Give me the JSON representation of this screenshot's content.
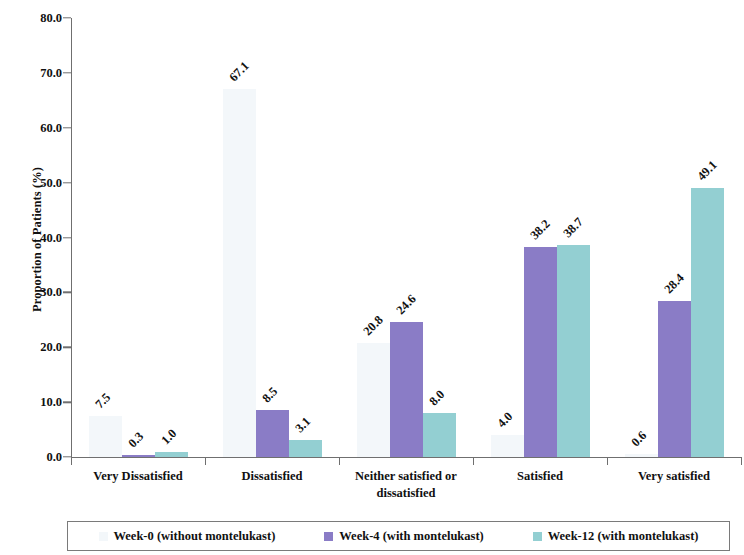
{
  "chart_data": {
    "type": "bar",
    "title": "",
    "xlabel": "",
    "ylabel": "Proportion of Patients (%)",
    "ylim": [
      0,
      80
    ],
    "ytick_labels": [
      "0.0",
      "10.0",
      "20.0",
      "30.0",
      "40.0",
      "50.0",
      "60.0",
      "70.0",
      "80.0"
    ],
    "ytick_values": [
      0,
      10,
      20,
      30,
      40,
      50,
      60,
      70,
      80
    ],
    "grid": false,
    "legend_position": "bottom",
    "categories": [
      "Very Dissatisfied",
      "Dissatisfied",
      "Neither satisfied or dissatisfied",
      "Satisfied",
      "Very satisfied"
    ],
    "category_lines": [
      [
        "Very Dissatisfied"
      ],
      [
        "Dissatisfied"
      ],
      [
        "Neither satisfied or",
        "dissatisfied"
      ],
      [
        "Satisfied"
      ],
      [
        "Very satisfied"
      ]
    ],
    "series": [
      {
        "name": "Week-0 (without montelukast)",
        "color": "#f3f7fa",
        "values": [
          7.5,
          67.1,
          20.8,
          4.0,
          0.6
        ],
        "labels": [
          "7.5",
          "67.1",
          "20.8",
          "4.0",
          "0.6"
        ]
      },
      {
        "name": "Week-4 (with montelukast)",
        "color": "#8a7cc6",
        "values": [
          0.3,
          8.5,
          24.6,
          38.2,
          28.4
        ],
        "labels": [
          "0.3",
          "8.5",
          "24.6",
          "38.2",
          "28.4"
        ]
      },
      {
        "name": "Week-12 (with montelukast)",
        "color": "#93cfd2",
        "values": [
          1.0,
          3.1,
          8.0,
          38.7,
          49.1
        ],
        "labels": [
          "1.0",
          "3.1",
          "8.0",
          "38.7",
          "49.1"
        ]
      }
    ]
  },
  "axis": {
    "y_title": "Proportion of Patients (%)"
  },
  "legend": {
    "items": [
      {
        "label": "Week-0 (without montelukast)",
        "color": "#f3f7fa"
      },
      {
        "label": "Week-4 (with montelukast)",
        "color": "#8a7cc6"
      },
      {
        "label": "Week-12 (with montelukast)",
        "color": "#93cfd2"
      }
    ]
  }
}
